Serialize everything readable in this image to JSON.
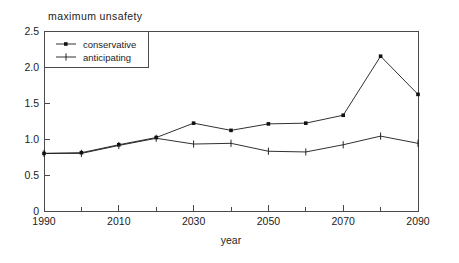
{
  "chart_data": {
    "type": "line",
    "title": "maximum unsafety",
    "xlabel": "year",
    "ylabel": "",
    "x": [
      1990,
      2000,
      2010,
      2020,
      2030,
      2040,
      2050,
      2060,
      2070,
      2080,
      2090
    ],
    "xlim": [
      1990,
      2090
    ],
    "ylim": [
      0,
      2.5
    ],
    "grid": false,
    "legend_position": "upper-left",
    "xticks_major": [
      1990,
      2010,
      2030,
      2050,
      2070,
      2090
    ],
    "xtick_labels": [
      "1990",
      "2010",
      "2030",
      "2050",
      "2070",
      "2090"
    ],
    "xticks_minor": [
      2000,
      2020,
      2040,
      2060,
      2080
    ],
    "yticks": [
      0,
      0.5,
      1.0,
      1.5,
      2.0,
      2.5
    ],
    "ytick_labels": [
      "0",
      "0.5",
      "1.0",
      "1.5",
      "2.0",
      "2.5"
    ],
    "series": [
      {
        "name": "conservative",
        "marker": "square",
        "color": "#111111",
        "values": [
          0.8,
          0.81,
          0.92,
          1.02,
          1.22,
          1.12,
          1.21,
          1.22,
          1.33,
          2.15,
          1.62
        ]
      },
      {
        "name": "anticipating",
        "marker": "plus",
        "color": "#111111",
        "values": [
          0.8,
          0.8,
          0.91,
          1.01,
          0.93,
          0.94,
          0.83,
          0.82,
          0.92,
          1.04,
          0.94
        ]
      }
    ]
  },
  "legend": {
    "entries": [
      {
        "label": "conservative"
      },
      {
        "label": "anticipating"
      }
    ]
  },
  "axes": {
    "title": "maximum unsafety",
    "xlabel": "year"
  }
}
